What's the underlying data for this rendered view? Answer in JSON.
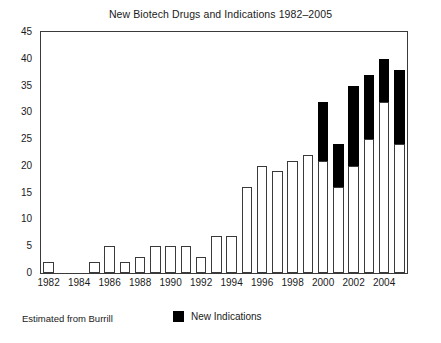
{
  "chart_data": {
    "type": "bar",
    "title": "New Biotech Drugs and Indications 1982–2005",
    "xlabel": "",
    "ylabel": "",
    "ylim": [
      0,
      45
    ],
    "ytick_step": 5,
    "yticks": [
      0,
      5,
      10,
      15,
      20,
      25,
      30,
      35,
      40,
      45
    ],
    "grid": false,
    "stacked": true,
    "legend_position": "bottom-center",
    "categories": [
      "1982",
      "1983",
      "1984",
      "1985",
      "1986",
      "1987",
      "1988",
      "1989",
      "1990",
      "1991",
      "1992",
      "1993",
      "1994",
      "1995",
      "1996",
      "1997",
      "1998",
      "1999",
      "2000",
      "2001",
      "2002",
      "2003",
      "2004",
      "2005"
    ],
    "xtick_labels": [
      "1982",
      "1984",
      "1986",
      "1988",
      "1990",
      "1992",
      "1994",
      "1996",
      "1998",
      "2000",
      "2002",
      "2004"
    ],
    "series": [
      {
        "name": "New Drugs",
        "color": "#ffffff",
        "edge_color": "#3a3a3a",
        "values": [
          2,
          0,
          0,
          2,
          5,
          2,
          3,
          5,
          5,
          5,
          3,
          7,
          7,
          16,
          20,
          19,
          21,
          22,
          21,
          16,
          20,
          25,
          32,
          24
        ]
      },
      {
        "name": "New Indications",
        "color": "#000000",
        "edge_color": "#000000",
        "values": [
          0,
          0,
          0,
          0,
          0,
          0,
          0,
          0,
          0,
          0,
          0,
          0,
          0,
          0,
          0,
          0,
          0,
          0,
          11,
          8,
          15,
          12,
          8,
          14
        ]
      }
    ],
    "totals": [
      2,
      0,
      0,
      2,
      5,
      2,
      3,
      5,
      5,
      5,
      3,
      7,
      7,
      16,
      20,
      19,
      21,
      22,
      32,
      24,
      35,
      37,
      40,
      38
    ],
    "annotations": {
      "source_note": "Estimated from Burrill"
    }
  },
  "legend": {
    "entries": [
      {
        "label": "New Indications",
        "color": "#000000"
      }
    ]
  }
}
